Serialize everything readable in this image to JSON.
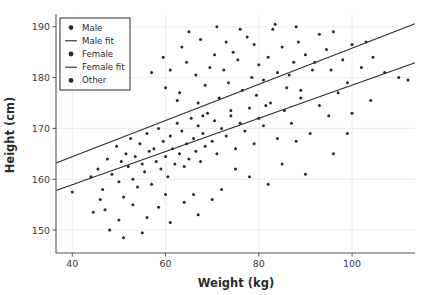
{
  "chart_data": {
    "type": "scatter",
    "title": "",
    "xlabel": "Weight (kg)",
    "ylabel": "Height (cm)",
    "xlim": [
      36.5,
      113.5
    ],
    "ylim": [
      145.5,
      192.5
    ],
    "xticks": [
      40,
      60,
      80,
      100
    ],
    "yticks": [
      150,
      160,
      170,
      180,
      190
    ],
    "grid": true,
    "grid_color": "#e8e8e8",
    "marker_color": "#2a2a2a",
    "line_color": "#2a2a2a",
    "marker_size": 3,
    "legend_position": "upper left",
    "legend": [
      {
        "label": "Male",
        "kind": "marker"
      },
      {
        "label": "Male fit",
        "kind": "line"
      },
      {
        "label": "Female",
        "kind": "marker"
      },
      {
        "label": "Female fit",
        "kind": "line"
      },
      {
        "label": "Other",
        "kind": "marker"
      }
    ],
    "series": [
      {
        "name": "Male",
        "kind": "scatter",
        "points": [
          [
            57.0,
            181.0
          ],
          [
            60.0,
            178.0
          ],
          [
            62.5,
            175.5
          ],
          [
            63.5,
            186.0
          ],
          [
            64.5,
            183.0
          ],
          [
            66.5,
            180.5
          ],
          [
            67.5,
            187.5
          ],
          [
            68.5,
            178.5
          ],
          [
            69.5,
            182.0
          ],
          [
            70.5,
            184.5
          ],
          [
            71.5,
            176.0
          ],
          [
            72.5,
            181.5
          ],
          [
            73.5,
            179.0
          ],
          [
            74.5,
            185.0
          ],
          [
            75.5,
            183.5
          ],
          [
            76.5,
            177.5
          ],
          [
            77.5,
            188.0
          ],
          [
            78.5,
            180.0
          ],
          [
            79.0,
            186.5
          ],
          [
            80.0,
            182.5
          ],
          [
            81.0,
            179.5
          ],
          [
            82.0,
            184.0
          ],
          [
            83.0,
            189.5
          ],
          [
            84.0,
            181.0
          ],
          [
            85.0,
            186.0
          ],
          [
            86.0,
            178.0
          ],
          [
            87.5,
            183.0
          ],
          [
            88.5,
            187.0
          ],
          [
            90.0,
            184.5
          ],
          [
            91.5,
            181.5
          ],
          [
            93.0,
            188.5
          ],
          [
            94.5,
            185.5
          ],
          [
            96.0,
            189.0
          ],
          [
            98.0,
            183.5
          ],
          [
            100.0,
            186.5
          ],
          [
            102.0,
            182.0
          ],
          [
            104.5,
            184.0
          ],
          [
            107.0,
            181.0
          ],
          [
            110.0,
            180.0
          ],
          [
            112.0,
            179.5
          ],
          [
            65.0,
            189.0
          ],
          [
            71.0,
            190.0
          ],
          [
            83.5,
            190.5
          ],
          [
            88.0,
            190.0
          ],
          [
            76.0,
            189.5
          ],
          [
            59.5,
            184.0
          ],
          [
            61.0,
            181.5
          ],
          [
            63.0,
            177.0
          ],
          [
            67.0,
            175.0
          ],
          [
            73.0,
            187.0
          ],
          [
            79.5,
            176.5
          ],
          [
            86.5,
            180.5
          ],
          [
            92.0,
            183.0
          ],
          [
            95.5,
            181.5
          ],
          [
            99.0,
            179.0
          ],
          [
            103.0,
            187.0
          ],
          [
            89.0,
            177.5
          ],
          [
            81.5,
            174.5
          ],
          [
            74.0,
            173.5
          ],
          [
            68.0,
            172.5
          ]
        ]
      },
      {
        "name": "Female",
        "kind": "scatter",
        "points": [
          [
            40.0,
            157.5
          ],
          [
            44.0,
            160.5
          ],
          [
            45.5,
            162.0
          ],
          [
            46.5,
            158.0
          ],
          [
            47.5,
            164.0
          ],
          [
            48.5,
            161.0
          ],
          [
            49.5,
            166.5
          ],
          [
            50.0,
            159.5
          ],
          [
            50.5,
            163.5
          ],
          [
            51.0,
            156.5
          ],
          [
            51.5,
            165.0
          ],
          [
            52.0,
            162.5
          ],
          [
            52.5,
            168.0
          ],
          [
            53.0,
            160.0
          ],
          [
            53.5,
            164.5
          ],
          [
            54.0,
            158.5
          ],
          [
            54.5,
            167.0
          ],
          [
            55.0,
            163.0
          ],
          [
            55.5,
            161.5
          ],
          [
            56.0,
            169.0
          ],
          [
            56.5,
            165.5
          ],
          [
            57.0,
            159.0
          ],
          [
            57.5,
            166.0
          ],
          [
            58.0,
            163.5
          ],
          [
            58.5,
            170.0
          ],
          [
            59.0,
            162.0
          ],
          [
            59.5,
            167.5
          ],
          [
            60.0,
            164.5
          ],
          [
            60.5,
            160.5
          ],
          [
            61.0,
            168.5
          ],
          [
            61.5,
            166.0
          ],
          [
            62.0,
            163.0
          ],
          [
            62.5,
            171.0
          ],
          [
            63.0,
            165.0
          ],
          [
            63.5,
            169.5
          ],
          [
            64.0,
            162.5
          ],
          [
            64.5,
            167.0
          ],
          [
            65.0,
            164.0
          ],
          [
            65.5,
            172.0
          ],
          [
            66.0,
            168.0
          ],
          [
            66.5,
            165.5
          ],
          [
            67.0,
            170.5
          ],
          [
            67.5,
            163.5
          ],
          [
            68.0,
            169.0
          ],
          [
            68.5,
            166.5
          ],
          [
            69.0,
            173.0
          ],
          [
            70.0,
            167.5
          ],
          [
            70.5,
            171.5
          ],
          [
            71.0,
            165.0
          ],
          [
            72.0,
            170.0
          ],
          [
            73.0,
            168.5
          ],
          [
            74.0,
            172.5
          ],
          [
            75.0,
            166.0
          ],
          [
            76.0,
            171.0
          ],
          [
            77.0,
            169.5
          ],
          [
            78.0,
            174.0
          ],
          [
            79.0,
            167.0
          ],
          [
            80.0,
            172.0
          ],
          [
            81.0,
            170.5
          ],
          [
            82.5,
            175.0
          ],
          [
            84.0,
            168.0
          ],
          [
            85.5,
            173.5
          ],
          [
            87.0,
            171.0
          ],
          [
            89.0,
            176.0
          ],
          [
            91.0,
            169.0
          ],
          [
            93.0,
            174.5
          ],
          [
            95.0,
            172.5
          ],
          [
            97.0,
            177.0
          ],
          [
            100.0,
            173.0
          ],
          [
            104.0,
            175.5
          ],
          [
            47.0,
            154.0
          ],
          [
            50.0,
            152.0
          ],
          [
            44.5,
            153.5
          ],
          [
            48.0,
            150.0
          ],
          [
            51.0,
            148.5
          ],
          [
            53.0,
            155.0
          ],
          [
            56.0,
            152.5
          ],
          [
            58.5,
            154.5
          ],
          [
            61.0,
            151.5
          ],
          [
            64.0,
            155.5
          ],
          [
            67.0,
            153.0
          ],
          [
            70.0,
            156.0
          ],
          [
            55.0,
            149.5
          ],
          [
            60.0,
            157.0
          ],
          [
            46.0,
            156.0
          ]
        ]
      },
      {
        "name": "Other",
        "kind": "scatter",
        "points": [
          [
            72.0,
            158.0
          ],
          [
            78.0,
            160.5
          ],
          [
            85.0,
            163.0
          ],
          [
            90.0,
            161.0
          ],
          [
            96.0,
            165.0
          ],
          [
            66.0,
            157.0
          ],
          [
            88.0,
            167.5
          ],
          [
            82.0,
            159.0
          ],
          [
            75.0,
            162.0
          ],
          [
            99.0,
            169.0
          ]
        ]
      },
      {
        "name": "Male fit",
        "kind": "line",
        "endpoints": [
          [
            36.5,
            163.2
          ],
          [
            113.5,
            190.6
          ]
        ]
      },
      {
        "name": "Female fit",
        "kind": "line",
        "endpoints": [
          [
            36.5,
            157.8
          ],
          [
            113.5,
            182.9
          ]
        ]
      }
    ]
  }
}
